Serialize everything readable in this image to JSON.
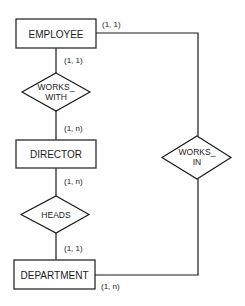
{
  "diagram": {
    "type": "entity-relationship",
    "entities": [
      {
        "id": "employee",
        "label": "EMPLOYEE"
      },
      {
        "id": "director",
        "label": "DIRECTOR"
      },
      {
        "id": "department",
        "label": "DEPARTMENT"
      }
    ],
    "relationships": [
      {
        "id": "works_with",
        "line1": "WORKS_",
        "line2": "WITH"
      },
      {
        "id": "heads",
        "line1": "HEADS"
      },
      {
        "id": "works_in",
        "line1": "WORKS_",
        "line2": "IN"
      }
    ],
    "cardinalities": {
      "employee_works_in": "(1, 1)",
      "employee_works_with": "(1, 1)",
      "director_works_with": "(1, n)",
      "director_heads": "(1, n)",
      "department_heads": "(1, 1)",
      "department_works_in": "(1, n)"
    },
    "colors": {
      "stroke": "#1a1a1a",
      "background": "#ffffff"
    }
  }
}
